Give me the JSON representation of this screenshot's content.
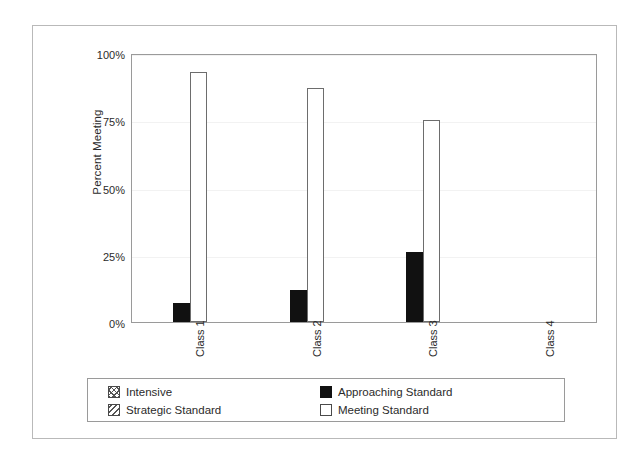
{
  "chart_data": {
    "type": "bar",
    "title": "",
    "xlabel": "",
    "ylabel": "Percent Meeting",
    "categories": [
      "Class 1",
      "Class 2",
      "Class 3",
      "Class 4"
    ],
    "ytick_labels": [
      "100%",
      "75%",
      "50%",
      "25%",
      "0%"
    ],
    "ytick_values": [
      100,
      75,
      50,
      25,
      0
    ],
    "ylim": [
      0,
      100
    ],
    "grid": true,
    "legend_position": "bottom",
    "series": [
      {
        "name": "Intensive",
        "pattern": "crosshatch",
        "values": [
          0,
          0,
          0,
          0
        ]
      },
      {
        "name": "Strategic Standard",
        "pattern": "diagonal-hatch",
        "values": [
          0,
          0,
          0,
          0
        ]
      },
      {
        "name": "Approaching Standard",
        "pattern": "solid-black",
        "values": [
          7,
          12,
          26,
          0
        ]
      },
      {
        "name": "Meeting Standard",
        "pattern": "white-outline",
        "values": [
          93,
          87,
          75,
          0
        ]
      }
    ]
  },
  "legend": {
    "entries": [
      {
        "label": "Intensive",
        "swatch": "crosshatch-swatch"
      },
      {
        "label": "Approaching Standard",
        "swatch": "solid-black-swatch"
      },
      {
        "label": "Strategic Standard",
        "swatch": "diagonal-hatch-swatch"
      },
      {
        "label": "Meeting Standard",
        "swatch": "white-outline-swatch"
      }
    ]
  },
  "colors": {
    "approaching_standard": "#111111",
    "meeting_standard_fill": "#ffffff",
    "meeting_standard_border": "#6d6d6d",
    "axis": "#9a9a9a",
    "gridline": "#f2f2f2",
    "text": "#2b2b2b",
    "page_border": "#b9b9b9"
  }
}
